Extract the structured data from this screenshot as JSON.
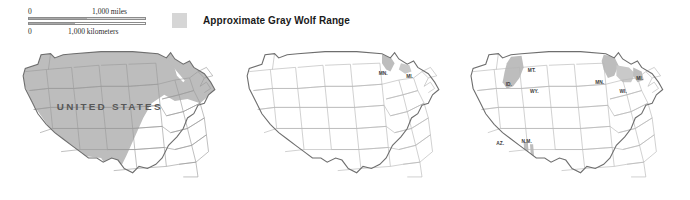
{
  "figure": {
    "title": "Approximate Gray Wolf Range",
    "panel_count": 3
  },
  "scale_bar": {
    "zero_top": "0",
    "top_label": "1,000  miles",
    "zero_bottom": "0",
    "bottom_label": "1,000  kilometers"
  },
  "legend": {
    "swatch_color": "#d6d6d6",
    "label": "Approximate Gray Wolf Range"
  },
  "colors": {
    "range_fill": "#cfcfcf",
    "state_fill": "#ffffff",
    "state_stroke": "#9a9a9a",
    "country_outline": "#6e6e6e",
    "label_text": "#3a3a3a",
    "country_label_text": "#585858",
    "background": "#ffffff"
  },
  "maps": [
    {
      "id": "map-historic",
      "name": "historic-range-map",
      "country_label": "UNITED STATES",
      "state_labels": [],
      "range_description": "Broad shading across western, plains, midwestern and northeastern United States"
    },
    {
      "id": "map-mid",
      "name": "reduced-range-map",
      "country_label": "",
      "state_labels": [
        {
          "text": "MN.",
          "x": 146,
          "y": 36
        },
        {
          "text": "MI.",
          "x": 168,
          "y": 38
        }
      ],
      "range_description": "Small remnant range in northern Minnesota and upper Michigan"
    },
    {
      "id": "map-recovery",
      "name": "recovery-range-map",
      "country_label": "",
      "state_labels": [
        {
          "text": "MT.",
          "x": 71,
          "y": 31
        },
        {
          "text": "ID.",
          "x": 50,
          "y": 45
        },
        {
          "text": "WY.",
          "x": 74,
          "y": 51
        },
        {
          "text": "MN.",
          "x": 145,
          "y": 44
        },
        {
          "text": "WI.",
          "x": 164,
          "y": 52
        },
        {
          "text": "MI.",
          "x": 178,
          "y": 41
        },
        {
          "text": "AZ.",
          "x": 46,
          "y": 104
        },
        {
          "text": "N.M.",
          "x": 70,
          "y": 102
        }
      ],
      "range_description": "Recovery areas in Montana/Idaho, Minnesota/Wisconsin/Michigan, and Arizona/New Mexico"
    }
  ]
}
